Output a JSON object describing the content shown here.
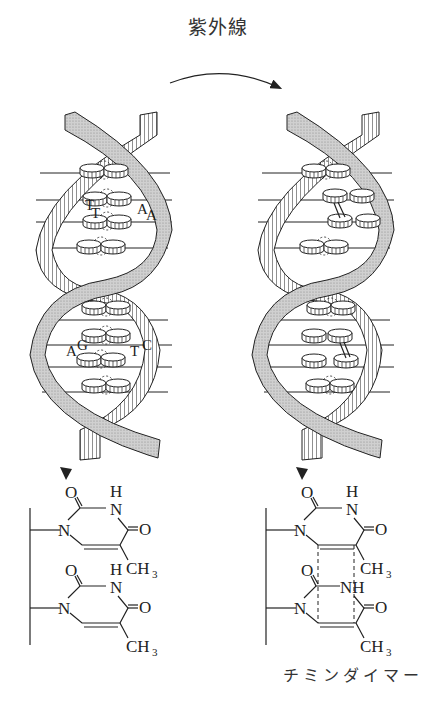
{
  "title": "紫外線",
  "caption": "チミンダイマー",
  "left_helix": {
    "labels_top": [
      "T",
      "T",
      "A",
      "A"
    ],
    "labels_bottom": [
      "A",
      "G",
      "T",
      "C"
    ]
  },
  "left_structure": {
    "atoms": {
      "o1": "O",
      "h1": "H",
      "n1": "N",
      "o2": "O",
      "n_ring": "N",
      "ch3": "CH",
      "sub3": "3"
    },
    "atoms2": {
      "o1": "O",
      "h1": "H",
      "n1": "N",
      "o2": "O",
      "n_ring": "N",
      "ch3": "CH",
      "sub3": "3"
    }
  },
  "right_structure": {
    "atoms": {
      "o1": "O",
      "h1": "H",
      "n1": "N",
      "o2": "O",
      "n_ring": "N",
      "ch3": "CH",
      "sub3": "3"
    },
    "atoms2": {
      "o1": "O",
      "nh": "NH",
      "o2": "O",
      "n_ring": "N",
      "ch3": "CH",
      "sub3": "3"
    }
  },
  "colors": {
    "ink": "#222222",
    "ribbon_fill": "#c8c8c8",
    "background": "#ffffff"
  }
}
